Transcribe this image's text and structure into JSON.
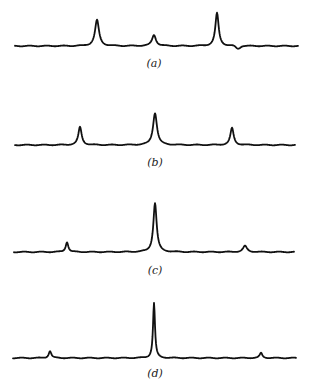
{
  "figure": {
    "panels": [
      {
        "label": "(a)",
        "baseline_y": 46,
        "x_start": 15,
        "x_end": 298,
        "peaks": [
          {
            "x": 97,
            "top_y": 20,
            "width": 6
          },
          {
            "x": 154,
            "top_y": 35,
            "width": 6
          },
          {
            "x": 217,
            "top_y": 13,
            "width": 5
          }
        ],
        "dip": {
          "x": 238,
          "y": 49
        },
        "label_pos": {
          "x": 154,
          "y": 57
        }
      },
      {
        "label": "(b)",
        "baseline_y": 145,
        "x_start": 15,
        "x_end": 295,
        "peaks": [
          {
            "x": 80,
            "top_y": 127,
            "width": 5
          },
          {
            "x": 155,
            "top_y": 113,
            "width": 6
          },
          {
            "x": 232,
            "top_y": 128,
            "width": 5
          }
        ],
        "label_pos": {
          "x": 155,
          "y": 156
        }
      },
      {
        "label": "(c)",
        "baseline_y": 252,
        "x_start": 14,
        "x_end": 294,
        "peaks": [
          {
            "x": 67,
            "top_y": 242,
            "width": 4
          },
          {
            "x": 155,
            "top_y": 203,
            "width": 5
          },
          {
            "x": 245,
            "top_y": 246,
            "width": 6
          }
        ],
        "label_pos": {
          "x": 155,
          "y": 264
        }
      },
      {
        "label": "(d)",
        "baseline_y": 358,
        "x_start": 13,
        "x_end": 296,
        "peaks": [
          {
            "x": 50,
            "top_y": 351,
            "width": 4
          },
          {
            "x": 154,
            "top_y": 303,
            "width": 3
          },
          {
            "x": 261,
            "top_y": 353,
            "width": 4
          }
        ],
        "label_pos": {
          "x": 155,
          "y": 367
        }
      }
    ]
  },
  "colors": {
    "trace": "#111111",
    "background": "#ffffff"
  }
}
